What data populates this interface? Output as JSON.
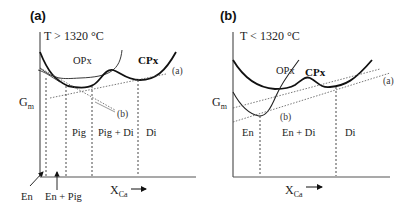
{
  "figure": {
    "panels": [
      {
        "id": "a",
        "label": "(a)",
        "temperature": "T > 1320 °C",
        "y_axis": "G",
        "y_axis_sub": "m",
        "x_axis": "X",
        "x_axis_sub": "Ca",
        "curves": {
          "opx": "OPx",
          "cpx": "CPx"
        },
        "tangents": {
          "a": "(a)",
          "b": "(b)"
        },
        "fields": [
          "Pig",
          "Pig + Di",
          "Di"
        ],
        "pointer_labels": [
          "En",
          "En + Pig"
        ]
      },
      {
        "id": "b",
        "label": "(b)",
        "temperature": "T < 1320 °C",
        "y_axis": "G",
        "y_axis_sub": "m",
        "x_axis": "X",
        "x_axis_sub": "Ca",
        "curves": {
          "opx": "OPx",
          "cpx": "CPx"
        },
        "tangents": {
          "a": "(a)",
          "b": "(b)"
        },
        "fields": [
          "En",
          "En + Di",
          "Di"
        ]
      }
    ]
  }
}
